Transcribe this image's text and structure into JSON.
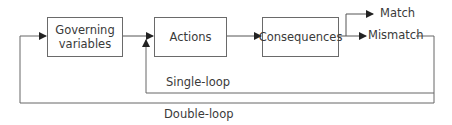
{
  "diagram": {
    "nodes": [
      {
        "id": "governing",
        "label_line1": "Governing",
        "label_line2": "variables"
      },
      {
        "id": "actions",
        "label": "Actions"
      },
      {
        "id": "consequences",
        "label": "Consequences"
      }
    ],
    "outcomes": {
      "match": "Match",
      "mismatch": "Mismatch"
    },
    "loops": {
      "single": "Single-loop",
      "double": "Double-loop"
    },
    "edges": [
      {
        "from": "governing",
        "to": "actions"
      },
      {
        "from": "actions",
        "to": "consequences"
      },
      {
        "from": "consequences",
        "to": "match"
      },
      {
        "from": "consequences",
        "to": "mismatch"
      },
      {
        "from": "mismatch",
        "to": "actions",
        "label": "Single-loop"
      },
      {
        "from": "mismatch",
        "to": "governing",
        "label": "Double-loop"
      }
    ],
    "colors": {
      "line": "#555555",
      "box_border": "#6a6a6a",
      "text": "#3a3a3a"
    }
  }
}
